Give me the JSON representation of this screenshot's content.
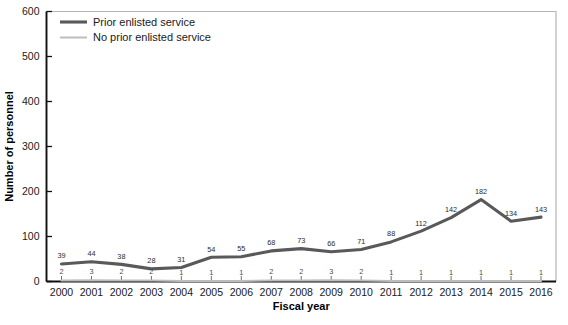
{
  "chart_data": {
    "type": "line",
    "title": "",
    "xlabel": "Fiscal year",
    "ylabel": "Number of personnel",
    "categories": [
      "2000",
      "2001",
      "2002",
      "2003",
      "2004",
      "2005",
      "2006",
      "2007",
      "2008",
      "2009",
      "2010",
      "2011",
      "2012",
      "2013",
      "2014",
      "2015",
      "2016"
    ],
    "ylim": [
      0,
      600
    ],
    "yticks": [
      0,
      100,
      200,
      300,
      400,
      500,
      600
    ],
    "grid": false,
    "legend_position": "top-left",
    "series": [
      {
        "name": "Prior enlisted service",
        "color": "#595959",
        "width": 3.1,
        "values": [
          39,
          44,
          38,
          28,
          31,
          54,
          55,
          68,
          73,
          66,
          71,
          88,
          112,
          142,
          182,
          134,
          143
        ]
      },
      {
        "name": "No prior enlisted service",
        "color": "#bdbdbd",
        "width": 2.0,
        "values": [
          2,
          3,
          2,
          2,
          1,
          1,
          1,
          2,
          2,
          3,
          2,
          1,
          1,
          1,
          1,
          1,
          1
        ]
      }
    ]
  },
  "axes": {
    "x_title": "Fiscal year",
    "y_title": "Number of personnel",
    "y_tick_labels": [
      "0",
      "100",
      "200",
      "300",
      "400",
      "500",
      "600"
    ],
    "x_tick_labels": [
      "2000",
      "2001",
      "2002",
      "2003",
      "2004",
      "2005",
      "2006",
      "2007",
      "2008",
      "2009",
      "2010",
      "2011",
      "2012",
      "2013",
      "2014",
      "2015",
      "2016"
    ]
  },
  "legend": {
    "items": [
      {
        "label": "Prior enlisted service",
        "color": "#595959"
      },
      {
        "label": "No prior enlisted service",
        "color": "#bdbdbd"
      }
    ]
  },
  "colors": {
    "primary_series": "#595959",
    "secondary_series": "#bdbdbd",
    "axis": "#111111",
    "frame": "#b5b5b5",
    "background": "#ffffff"
  }
}
